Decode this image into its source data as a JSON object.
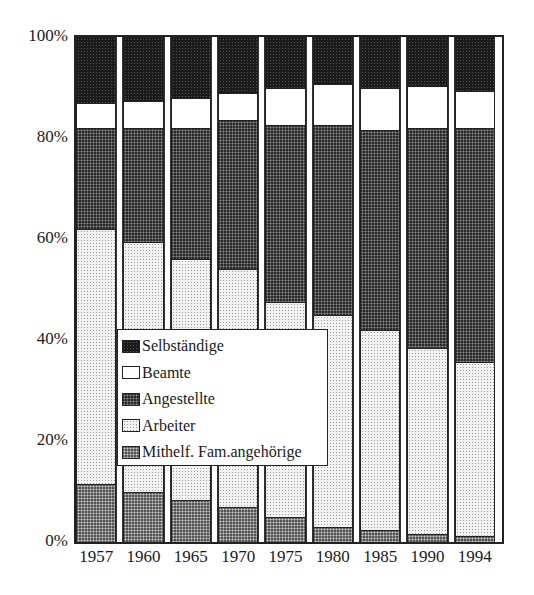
{
  "chart_data": {
    "type": "bar",
    "stacked": true,
    "percent_stacked": true,
    "title": "",
    "xlabel": "",
    "ylabel": "",
    "ylim": [
      0,
      100
    ],
    "yticks": [
      "0%",
      "20%",
      "40%",
      "60%",
      "80%",
      "100%"
    ],
    "categories": [
      "1957",
      "1960",
      "1965",
      "1970",
      "1975",
      "1980",
      "1985",
      "1990",
      "1994"
    ],
    "series": [
      {
        "name": "Mithelf. Fam.angehörige",
        "values": [
          11.5,
          10.0,
          8.3,
          7.0,
          5.0,
          3.0,
          2.3,
          1.6,
          1.2
        ]
      },
      {
        "name": "Arbeiter",
        "values": [
          50.5,
          49.5,
          47.7,
          47.0,
          42.5,
          42.0,
          39.7,
          36.9,
          34.5
        ]
      },
      {
        "name": "Angestellte",
        "values": [
          20.0,
          22.5,
          26.0,
          29.5,
          35.0,
          37.5,
          39.5,
          43.5,
          46.3
        ]
      },
      {
        "name": "Beamte",
        "values": [
          5.0,
          5.3,
          6.0,
          5.5,
          7.5,
          8.2,
          8.5,
          8.3,
          7.3
        ]
      },
      {
        "name": "Selbständige",
        "values": [
          13.0,
          12.7,
          12.0,
          11.0,
          10.0,
          9.3,
          10.0,
          9.7,
          10.7
        ]
      }
    ],
    "legend": {
      "position": "inside-lower-left",
      "entries": [
        "Selbständige",
        "Beamte",
        "Angestellte",
        "Arbeiter",
        "Mithelf. Fam.angehörige"
      ]
    },
    "grid": false
  },
  "axis": {
    "y_labels": [
      "100%",
      "80%",
      "60%",
      "40%",
      "20%",
      "0%"
    ],
    "x_labels": [
      "1957",
      "1960",
      "1965",
      "1970",
      "1975",
      "1980",
      "1985",
      "1990",
      "1994"
    ]
  },
  "legend": {
    "items": [
      {
        "label": "Selbständige",
        "pattern": "selb"
      },
      {
        "label": "Beamte",
        "pattern": "beam"
      },
      {
        "label": "Angestellte",
        "pattern": "ange"
      },
      {
        "label": "Arbeiter",
        "pattern": "arb"
      },
      {
        "label": "Mithelf. Fam.angehörige",
        "pattern": "mith"
      }
    ]
  }
}
